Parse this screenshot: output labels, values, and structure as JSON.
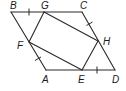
{
  "figure": {
    "line_color": "#2a2a2a",
    "label_color": "#1a1a1a"
  },
  "vertices": {
    "B": {
      "label": "B",
      "x": 11,
      "y": 12
    },
    "G": {
      "label": "G",
      "x": 44,
      "y": 12
    },
    "C": {
      "label": "C",
      "x": 82,
      "y": 12
    },
    "H": {
      "label": "H",
      "x": 98,
      "y": 41
    },
    "D": {
      "label": "D",
      "x": 115,
      "y": 70
    },
    "E": {
      "label": "E",
      "x": 82,
      "y": 70
    },
    "A": {
      "label": "A",
      "x": 46,
      "y": 70
    },
    "F": {
      "label": "F",
      "x": 29,
      "y": 42
    }
  },
  "labels": {
    "B": "B",
    "G": "G",
    "C": "C",
    "H": "H",
    "D": "D",
    "E": "E",
    "A": "A",
    "F": "F"
  },
  "segments": {
    "outer": [
      "BC",
      "CD",
      "DA",
      "AB"
    ],
    "inner": [
      "GH",
      "HE",
      "EF",
      "FG"
    ]
  },
  "tick_marks": [
    "BG",
    "CH",
    "AF",
    "ED"
  ]
}
